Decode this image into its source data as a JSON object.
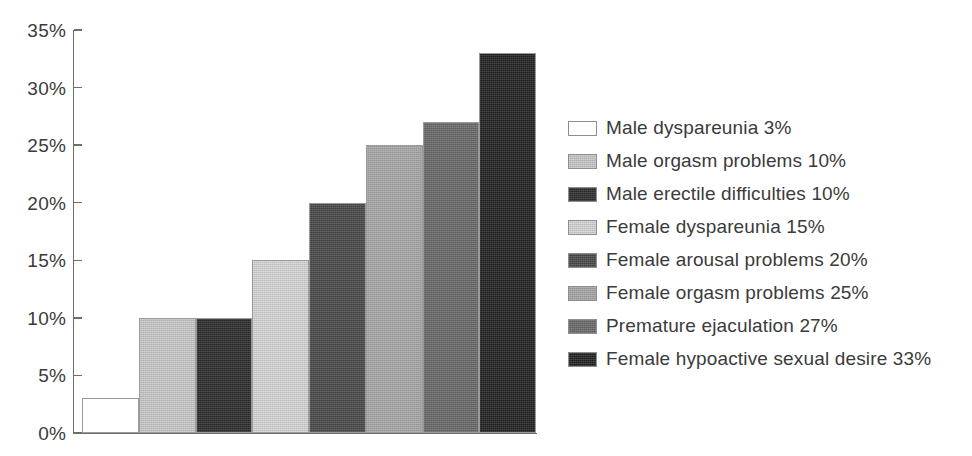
{
  "chart_data": {
    "type": "bar",
    "title": "",
    "subtitle": "",
    "xlabel": "",
    "ylabel": "",
    "ylim": [
      0,
      35
    ],
    "ytick_labels": [
      "0%",
      "5%",
      "10%",
      "15%",
      "20%",
      "25%",
      "30%",
      "35%"
    ],
    "ytick_values": [
      0,
      5,
      10,
      15,
      20,
      25,
      30,
      35
    ],
    "ytick_suffix": "%",
    "grid": false,
    "legend_position": "right",
    "xtick_labels": [],
    "categories": [
      "Male dyspareunia",
      "Male orgasm problems",
      "Male erectile difficulties",
      "Female dyspareunia",
      "Female arousal problems",
      "Female orgasm problems",
      "Premature ejaculation",
      "Female hypoactive sexual desire"
    ],
    "values": [
      3,
      10,
      10,
      15,
      20,
      25,
      27,
      33
    ],
    "value_labels": [
      "3%",
      "10%",
      "10%",
      "15%",
      "20%",
      "25%",
      "27%",
      "33%"
    ],
    "bar_colors": [
      "#ffffff",
      "#c9c9c9",
      "#2e2e2e",
      "#d6d6d6",
      "#4a4a4a",
      "#a8a8a8",
      "#6b6b6b",
      "#242424"
    ],
    "series": [
      {
        "name": "Prevalence",
        "values": [
          3,
          10,
          10,
          15,
          20,
          25,
          27,
          33
        ]
      }
    ]
  },
  "legend": {
    "entries": [
      {
        "label": "Male dyspareunia 3%",
        "swatch_name": "legend-swatch-male-dyspareunia",
        "color": "#ffffff"
      },
      {
        "label": "Male orgasm problems 10%",
        "swatch_name": "legend-swatch-male-orgasm-problems",
        "color": "#c9c9c9"
      },
      {
        "label": "Male erectile difficulties 10%",
        "swatch_name": "legend-swatch-male-erectile-difficulties",
        "color": "#2e2e2e"
      },
      {
        "label": "Female dyspareunia 15%",
        "swatch_name": "legend-swatch-female-dyspareunia",
        "color": "#d6d6d6"
      },
      {
        "label": "Female arousal problems 20%",
        "swatch_name": "legend-swatch-female-arousal-problems",
        "color": "#4a4a4a"
      },
      {
        "label": "Female orgasm problems 25%",
        "swatch_name": "legend-swatch-female-orgasm-problems",
        "color": "#a8a8a8"
      },
      {
        "label": "Premature ejaculation 27%",
        "swatch_name": "legend-swatch-premature-ejaculation",
        "color": "#6b6b6b"
      },
      {
        "label": "Female hypoactive sexual desire 33%",
        "swatch_name": "legend-swatch-female-hypoactive-sexual-desire",
        "color": "#242424"
      }
    ]
  },
  "style": {
    "background": "#ffffff",
    "axis_color": "#6e6e6e",
    "text_color": "#3b3b3b",
    "bar_border_color": "#9a9a9a"
  }
}
